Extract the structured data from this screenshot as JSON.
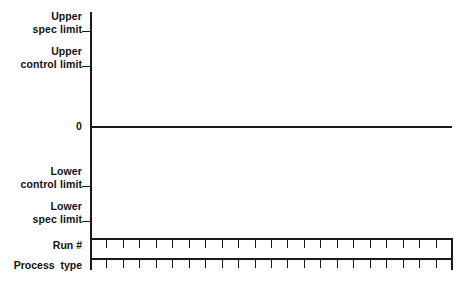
{
  "chart_data": {
    "type": "line",
    "title": "",
    "xlabel": "",
    "ylabel": "",
    "series": [
      {
        "name": "centerline",
        "values": []
      }
    ],
    "y_tick_labels": [
      "Upper\nspec limit",
      "Upper\ncontrol limit",
      "0",
      "Lower\ncontrol limit",
      "Lower\nspec limit"
    ],
    "y_tick_values": [
      3,
      2,
      0,
      -2,
      -3
    ],
    "grid": false,
    "legend": "none",
    "note": "blank statistical process control chart template; only the zero centerline is drawn, no data points plotted",
    "bottom_table": {
      "row_labels": [
        "Run #",
        "Process  type"
      ],
      "columns": 22,
      "cells": [
        [
          "",
          "",
          "",
          "",
          "",
          "",
          "",
          "",
          "",
          "",
          "",
          "",
          "",
          "",
          "",
          "",
          "",
          "",
          "",
          "",
          "",
          ""
        ],
        [
          "",
          "",
          "",
          "",
          "",
          "",
          "",
          "",
          "",
          "",
          "",
          "",
          "",
          "",
          "",
          "",
          "",
          "",
          "",
          "",
          "",
          ""
        ]
      ]
    }
  },
  "axis": {
    "labels": {
      "upper_spec_limit": "Upper\nspec limit",
      "upper_control_limit": "Upper\ncontrol limit",
      "zero": "0",
      "lower_control_limit": "Lower\ncontrol limit",
      "lower_spec_limit": "Lower\nspec limit"
    }
  },
  "table": {
    "run_label": "Run #",
    "process_label": "Process  type"
  },
  "colors": {
    "line": "#1a1a1a",
    "text": "#111111",
    "background": "#ffffff"
  }
}
